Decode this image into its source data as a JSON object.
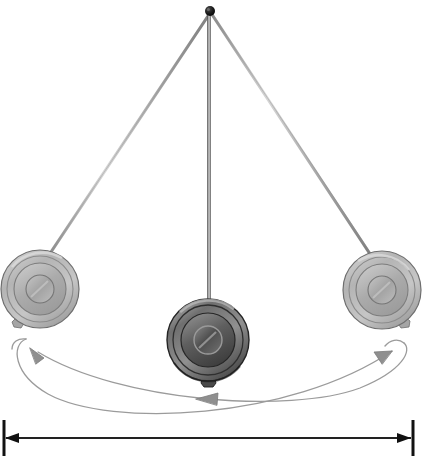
{
  "figure": {
    "name": "pendulum-swing-diagram",
    "background_color": "#ffffff",
    "width": 425,
    "height": 456
  },
  "pivot": {
    "name": "pivot-point",
    "x": 210,
    "y": 11,
    "radius": 4.5,
    "color": "#141414"
  },
  "rods": [
    {
      "name": "rod-left",
      "label": "left extreme rod",
      "x1": 210,
      "y1": 13,
      "x2": 47,
      "y2": 258,
      "width": 3.1,
      "color": "#9a9a9a"
    },
    {
      "name": "rod-center",
      "label": "equilibrium rod",
      "x1": 209,
      "y1": 13,
      "x2": 209,
      "y2": 312,
      "width": 3.6,
      "color": "#6c6c6c"
    },
    {
      "name": "rod-right",
      "label": "right extreme rod",
      "x1": 211,
      "y1": 13,
      "x2": 372,
      "y2": 257,
      "width": 3.1,
      "color": "#9a9a9a"
    }
  ],
  "bobs": [
    {
      "name": "bob-left",
      "label": "pendulum bob at left extreme",
      "cx": 40,
      "cy": 289,
      "r_outer": 39,
      "r_rim": 33,
      "r_face": 26,
      "r_hub": 14,
      "tone": "light",
      "rim_color": "#b5b5b5",
      "face_color": "#a8a8a8",
      "hub_color": "#9d9d9d",
      "edge_color": "#6e6e6e",
      "nut_angle_deg": 125
    },
    {
      "name": "bob-center",
      "label": "pendulum bob at equilibrium",
      "cx": 208,
      "cy": 340,
      "r_outer": 41,
      "r_rim": 35,
      "r_face": 27,
      "r_hub": 14,
      "tone": "dark",
      "rim_color": "#808080",
      "face_color": "#6a6a6a",
      "hub_color": "#5c5c5c",
      "edge_color": "#2d2d2d",
      "nut_angle_deg": 92
    },
    {
      "name": "bob-right",
      "label": "pendulum bob at right extreme",
      "cx": 382,
      "cy": 290,
      "r_outer": 39,
      "r_rim": 33,
      "r_face": 26,
      "r_hub": 14,
      "tone": "light",
      "rim_color": "#b5b5b5",
      "face_color": "#a8a8a8",
      "hub_color": "#9d9d9d",
      "edge_color": "#6e6e6e",
      "nut_angle_deg": 55
    }
  ],
  "arcs": [
    {
      "name": "swing-arc-outer",
      "label": "outer swing arc, left to right",
      "direction": "left-to-right",
      "path": "M 14 341 C 10 368 60 406 130 414 C 215 423 330 404 400 352",
      "color": "#9b9b9b",
      "width": 1.3,
      "arrowhead": {
        "name": "arrowhead-right-end",
        "x": 396,
        "y": 353,
        "angle_deg": -38
      }
    },
    {
      "name": "swing-arc-inner",
      "label": "inner swing arc, right to left",
      "direction": "right-to-left",
      "path": "M 406 346 C 404 376 330 401 250 399 C 170 396 80 382 30 349",
      "color": "#9b9b9b",
      "width": 1.3,
      "arrowhead": {
        "name": "arrowhead-left-end",
        "x": 34,
        "y": 352,
        "angle_deg": 145
      }
    }
  ],
  "mid_arrow": {
    "name": "arrowhead-mid-left",
    "label": "midpoint direction arrow pointing left",
    "x": 202,
    "y": 399,
    "angle_deg": 182,
    "color": "#8f8f8f"
  },
  "dimension": {
    "name": "amplitude-dimension-line",
    "label": "total swing amplitude",
    "y": 438,
    "x_left": 5,
    "x_right": 412,
    "line_color": "#222222",
    "line_width": 2.0,
    "tick_color": "#111111",
    "tick_half_height": 18,
    "tick_width": 3,
    "left_arrow": {
      "name": "dimension-arrow-left",
      "direction": "left"
    },
    "right_arrow": {
      "name": "dimension-arrow-right",
      "direction": "right"
    }
  }
}
